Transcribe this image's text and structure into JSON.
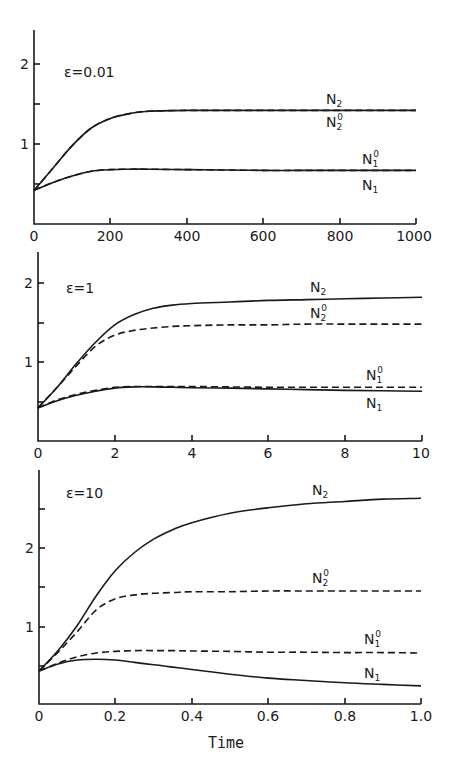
{
  "chart_data": [
    {
      "type": "line",
      "title": "ε=0.01",
      "xlabel": "",
      "ylabel": "",
      "xlim": [
        0,
        1000
      ],
      "ylim": [
        0,
        2.45
      ],
      "xticks": [
        0,
        200,
        400,
        600,
        800,
        1000
      ],
      "xtick_labels": [
        "0",
        "200",
        "400",
        "600",
        "800",
        "1000"
      ],
      "yticks": [
        0.5,
        1,
        1.5,
        2
      ],
      "ytick_labels": [
        "",
        "1",
        "",
        "2"
      ],
      "grid": false,
      "x": [
        0,
        50,
        100,
        150,
        200,
        250,
        300,
        400,
        500,
        600,
        700,
        800,
        900,
        1000
      ],
      "series": [
        {
          "name": "N2",
          "style": "solid",
          "values": [
            0.42,
            0.7,
            0.98,
            1.2,
            1.32,
            1.38,
            1.41,
            1.42,
            1.42,
            1.42,
            1.42,
            1.42,
            1.42,
            1.42
          ]
        },
        {
          "name": "N2^0",
          "style": "dashed",
          "values": [
            0.42,
            0.7,
            0.98,
            1.2,
            1.32,
            1.38,
            1.41,
            1.42,
            1.42,
            1.42,
            1.42,
            1.42,
            1.42,
            1.42
          ]
        },
        {
          "name": "N1^0",
          "style": "dashed",
          "values": [
            0.42,
            0.52,
            0.6,
            0.66,
            0.68,
            0.685,
            0.685,
            0.68,
            0.675,
            0.67,
            0.67,
            0.67,
            0.67,
            0.67
          ]
        },
        {
          "name": "N1",
          "style": "solid",
          "values": [
            0.42,
            0.52,
            0.6,
            0.66,
            0.68,
            0.685,
            0.685,
            0.68,
            0.675,
            0.67,
            0.67,
            0.67,
            0.67,
            0.67
          ]
        }
      ]
    },
    {
      "type": "line",
      "title": "ε=1",
      "xlabel": "",
      "ylabel": "",
      "xlim": [
        0,
        10
      ],
      "ylim": [
        0,
        2.45
      ],
      "xticks": [
        0,
        2,
        4,
        6,
        8,
        10
      ],
      "xtick_labels": [
        "0",
        "2",
        "4",
        "6",
        "8",
        "10"
      ],
      "yticks": [
        0.5,
        1,
        1.5,
        2
      ],
      "ytick_labels": [
        "",
        "1",
        "",
        "2"
      ],
      "grid": false,
      "x": [
        0,
        0.5,
        1,
        1.5,
        2,
        2.5,
        3,
        3.5,
        4,
        5,
        6,
        7,
        8,
        9,
        10
      ],
      "series": [
        {
          "name": "N2",
          "style": "solid",
          "values": [
            0.42,
            0.68,
            0.98,
            1.25,
            1.47,
            1.6,
            1.68,
            1.72,
            1.74,
            1.76,
            1.78,
            1.79,
            1.8,
            1.81,
            1.82
          ]
        },
        {
          "name": "N2^0",
          "style": "dashed",
          "values": [
            0.42,
            0.68,
            0.95,
            1.2,
            1.34,
            1.4,
            1.43,
            1.45,
            1.46,
            1.47,
            1.47,
            1.48,
            1.48,
            1.48,
            1.48
          ]
        },
        {
          "name": "N1^0",
          "style": "dashed",
          "values": [
            0.42,
            0.52,
            0.59,
            0.64,
            0.68,
            0.69,
            0.69,
            0.69,
            0.69,
            0.685,
            0.68,
            0.68,
            0.68,
            0.68,
            0.68
          ]
        },
        {
          "name": "N1",
          "style": "solid",
          "values": [
            0.42,
            0.51,
            0.58,
            0.63,
            0.67,
            0.685,
            0.685,
            0.68,
            0.675,
            0.67,
            0.66,
            0.65,
            0.64,
            0.635,
            0.63
          ]
        }
      ]
    },
    {
      "type": "line",
      "title": "ε=10",
      "xlabel": "Time",
      "ylabel": "",
      "xlim": [
        0,
        1.0
      ],
      "ylim": [
        0,
        2.95
      ],
      "xticks": [
        0,
        0.2,
        0.4,
        0.6,
        0.8,
        1.0
      ],
      "xtick_labels": [
        "0",
        "0.2",
        "0.4",
        "0.6",
        "0.8",
        "1.0"
      ],
      "yticks": [
        0.5,
        1,
        1.5,
        2,
        2.5
      ],
      "ytick_labels": [
        "",
        "1",
        "",
        "2",
        ""
      ],
      "grid": false,
      "x": [
        0,
        0.05,
        0.1,
        0.15,
        0.2,
        0.25,
        0.3,
        0.35,
        0.4,
        0.5,
        0.6,
        0.7,
        0.8,
        0.9,
        1.0
      ],
      "series": [
        {
          "name": "N2",
          "style": "solid",
          "values": [
            0.42,
            0.68,
            1.0,
            1.38,
            1.7,
            1.93,
            2.1,
            2.22,
            2.31,
            2.43,
            2.5,
            2.55,
            2.58,
            2.61,
            2.62
          ]
        },
        {
          "name": "N2^0",
          "style": "dashed",
          "values": [
            0.42,
            0.66,
            0.92,
            1.2,
            1.34,
            1.39,
            1.41,
            1.42,
            1.43,
            1.43,
            1.44,
            1.44,
            1.44,
            1.44,
            1.44
          ]
        },
        {
          "name": "N1^0",
          "style": "dashed",
          "values": [
            0.42,
            0.52,
            0.6,
            0.65,
            0.67,
            0.68,
            0.68,
            0.68,
            0.675,
            0.67,
            0.66,
            0.66,
            0.655,
            0.655,
            0.65
          ]
        },
        {
          "name": "N1",
          "style": "solid",
          "values": [
            0.42,
            0.51,
            0.56,
            0.57,
            0.56,
            0.53,
            0.5,
            0.47,
            0.44,
            0.38,
            0.33,
            0.3,
            0.27,
            0.25,
            0.23
          ]
        }
      ]
    }
  ],
  "panels": [
    {
      "epsilon_label": "ε=0.01",
      "xtick_labels": [
        "0",
        "200",
        "400",
        "600",
        "800",
        "1000"
      ],
      "ytick_labels": {
        "one": "1",
        "two": "2"
      },
      "series_labels": {
        "N2": "N",
        "N2_sub": "2",
        "N2o": "N",
        "N2o_sub": "2",
        "N2o_sup": "0",
        "N1o": "N",
        "N1o_sub": "1",
        "N1o_sup": "0",
        "N1": "N",
        "N1_sub": "1"
      }
    },
    {
      "epsilon_label": "ε=1",
      "xtick_labels": [
        "0",
        "2",
        "4",
        "6",
        "8",
        "10"
      ],
      "ytick_labels": {
        "one": "1",
        "two": "2"
      },
      "series_labels": {
        "N2": "N",
        "N2_sub": "2",
        "N2o": "N",
        "N2o_sub": "2",
        "N2o_sup": "0",
        "N1o": "N",
        "N1o_sub": "1",
        "N1o_sup": "0",
        "N1": "N",
        "N1_sub": "1"
      }
    },
    {
      "epsilon_label": "ε=10",
      "xtick_labels": [
        "0",
        "0.2",
        "0.4",
        "0.6",
        "0.8",
        "1.0"
      ],
      "ytick_labels": {
        "one": "1",
        "two": "2"
      },
      "series_labels": {
        "N2": "N",
        "N2_sub": "2",
        "N2o": "N",
        "N2o_sub": "2",
        "N2o_sup": "0",
        "N1o": "N",
        "N1o_sub": "1",
        "N1o_sup": "0",
        "N1": "N",
        "N1_sub": "1"
      }
    }
  ],
  "x_axis_title": "Time"
}
